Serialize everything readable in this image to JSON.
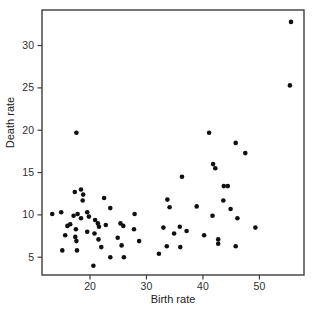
{
  "figure": {
    "background": "#ffffff",
    "box_color": "#3d3d3d",
    "tick_color": "#3d3d3d",
    "point_color": "#101010",
    "text_color": "#2e2e2e"
  },
  "chart_data": {
    "type": "scatter",
    "title": "",
    "xlabel": "Birth rate",
    "ylabel": "Death rate",
    "xlim": [
      11.5,
      57.9
    ],
    "ylim": [
      2.9,
      34.2
    ],
    "x_ticks": [
      20,
      30,
      40,
      50
    ],
    "y_ticks": [
      5,
      10,
      15,
      20,
      25,
      30
    ],
    "grid": false,
    "legend_position": "none",
    "marker": "filled-circle",
    "marker_radius_px": 2.3,
    "points": [
      [
        17.6,
        19.7
      ],
      [
        55.6,
        32.8
      ],
      [
        55.4,
        25.3
      ],
      [
        41.1,
        19.7
      ],
      [
        45.8,
        18.5
      ],
      [
        47.5,
        17.3
      ],
      [
        36.3,
        14.5
      ],
      [
        41.8,
        16.0
      ],
      [
        42.2,
        15.5
      ],
      [
        43.7,
        13.4
      ],
      [
        44.4,
        13.4
      ],
      [
        43.6,
        11.7
      ],
      [
        44.9,
        10.7
      ],
      [
        38.9,
        11.0
      ],
      [
        41.7,
        9.9
      ],
      [
        46.1,
        9.6
      ],
      [
        49.3,
        8.5
      ],
      [
        40.2,
        7.6
      ],
      [
        42.7,
        7.1
      ],
      [
        42.7,
        6.6
      ],
      [
        45.8,
        6.3
      ],
      [
        33.7,
        11.8
      ],
      [
        34.1,
        10.9
      ],
      [
        27.9,
        10.1
      ],
      [
        27.8,
        8.3
      ],
      [
        28.7,
        6.9
      ],
      [
        33.0,
        8.5
      ],
      [
        34.9,
        7.8
      ],
      [
        35.9,
        8.6
      ],
      [
        37.1,
        8.1
      ],
      [
        33.6,
        6.3
      ],
      [
        36.0,
        6.2
      ],
      [
        32.2,
        5.4
      ],
      [
        17.3,
        12.7
      ],
      [
        18.4,
        13.0
      ],
      [
        18.8,
        12.4
      ],
      [
        18.7,
        11.7
      ],
      [
        22.5,
        12.0
      ],
      [
        23.6,
        10.8
      ],
      [
        13.3,
        10.1
      ],
      [
        14.9,
        10.3
      ],
      [
        17.1,
        9.9
      ],
      [
        17.8,
        10.1
      ],
      [
        19.5,
        10.3
      ],
      [
        19.8,
        9.8
      ],
      [
        18.4,
        9.6
      ],
      [
        20.9,
        9.4
      ],
      [
        21.4,
        9.0
      ],
      [
        21.6,
        8.6
      ],
      [
        22.8,
        8.8
      ],
      [
        25.4,
        9.0
      ],
      [
        25.9,
        8.7
      ],
      [
        16.0,
        8.7
      ],
      [
        16.5,
        8.9
      ],
      [
        17.5,
        8.3
      ],
      [
        19.5,
        8.0
      ],
      [
        15.6,
        7.6
      ],
      [
        17.4,
        7.4
      ],
      [
        20.8,
        7.8
      ],
      [
        17.6,
        6.9
      ],
      [
        21.5,
        7.1
      ],
      [
        15.1,
        5.8
      ],
      [
        17.7,
        5.8
      ],
      [
        22.0,
        6.2
      ],
      [
        24.9,
        7.3
      ],
      [
        25.6,
        6.4
      ],
      [
        23.6,
        5.0
      ],
      [
        26.0,
        5.0
      ],
      [
        20.6,
        4.0
      ]
    ],
    "plot_box_px": {
      "left": 42,
      "top": 10,
      "right": 304,
      "bottom": 275
    },
    "tick_length_px": 4.5
  }
}
